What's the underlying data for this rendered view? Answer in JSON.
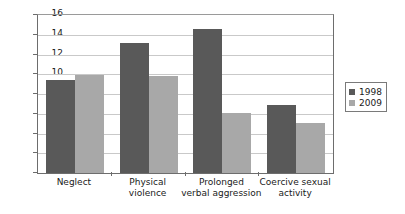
{
  "chart_data": {
    "type": "bar",
    "title": "",
    "subtitle": "",
    "xlabel": "",
    "ylabel": "",
    "ylim": [
      0,
      16
    ],
    "y_ticks": [
      0,
      2,
      4,
      6,
      8,
      10,
      12,
      14,
      16
    ],
    "y_tick_labels": [
      "0",
      "2",
      "4",
      "6",
      "8",
      "10",
      "12",
      "14",
      "16"
    ],
    "grid": "horizontal",
    "legend_position": "right",
    "categories": [
      "Neglect",
      "Physical violence",
      "Prolonged verbal aggression",
      "Coercive sexual activity"
    ],
    "category_lines": [
      [
        "Neglect"
      ],
      [
        "Physical",
        "violence"
      ],
      [
        "Prolonged",
        "verbal aggression"
      ],
      [
        "Coercive sexual",
        "activity"
      ]
    ],
    "series": [
      {
        "name": "1998",
        "color": "#595959",
        "values": [
          9.4,
          13.2,
          14.6,
          6.9
        ]
      },
      {
        "name": "2009",
        "color": "#a8a8a8",
        "values": [
          9.9,
          9.8,
          6.1,
          5.1
        ]
      }
    ]
  },
  "legend": {
    "entries": [
      {
        "label": "1998"
      },
      {
        "label": "2009"
      }
    ]
  },
  "colors": {
    "series_1998": "#595959",
    "series_2009": "#a8a8a8",
    "gridline": "#c9c9c9",
    "axis": "#6d6d6d",
    "background": "#ffffff",
    "text": "#1a1a1a"
  }
}
